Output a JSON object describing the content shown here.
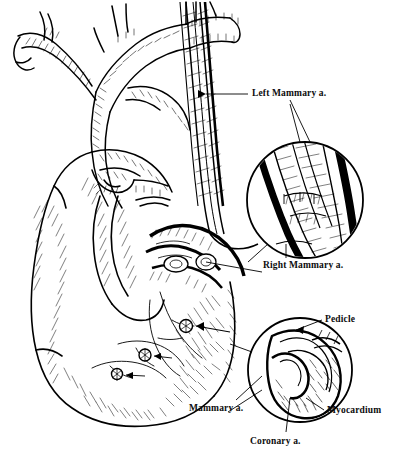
{
  "figure": {
    "medium": "pen-and-ink line drawing",
    "background_color": "#ffffff",
    "ink_color": "#000000",
    "width": 393,
    "height": 465
  },
  "labels": {
    "left_mammary": "Left Mammary a.",
    "right_mammary": "Right Mammary a.",
    "pedicle": "Pedicle",
    "myocardium": "Myocardium",
    "mammary": "Mammary a.",
    "coronary": "Coronary a."
  },
  "structures": {
    "aortic_arch": "aortic arch",
    "brachiocephalic": "brachiocephalic trunk",
    "subclavian": "subclavian artery",
    "pulmonary_artery": "pulmonary artery",
    "ventricle": "left ventricle",
    "anastomosis_sites": 3
  },
  "insets": {
    "upper": {
      "name": "mammary-artery-pedicle-detail",
      "center_x": 305,
      "center_y": 200,
      "radius": 58
    },
    "lower": {
      "name": "anastomosis-cross-section-detail",
      "center_x": 300,
      "center_y": 370,
      "radius": 52
    }
  }
}
